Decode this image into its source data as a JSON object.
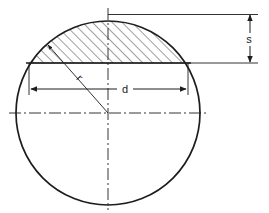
{
  "diagram": {
    "type": "engineering-cross-section",
    "stroke_color": "#1d1d1d",
    "hatch_color": "#2a2a2a",
    "background_color": "#ffffff",
    "shape": {
      "name": "circle",
      "center_x": 108,
      "center_y": 113,
      "radius": 92
    },
    "chord": {
      "y": 63,
      "left_x": 29,
      "right_x": 188
    },
    "labels": {
      "segment_height": "s",
      "chord_width": "d",
      "radius": "r"
    },
    "dimensions": [
      {
        "name": "segment-height",
        "label": "s",
        "orientation": "vertical",
        "line_x": 250,
        "from_y": 14,
        "to_y": 63,
        "label_x": 249,
        "label_y": 42
      },
      {
        "name": "chord-width",
        "label": "d",
        "orientation": "horizontal",
        "line_y": 89,
        "from_x": 29,
        "to_x": 188,
        "label_x": 125,
        "label_y": 92
      },
      {
        "name": "radius",
        "label": "r",
        "orientation": "diagonal",
        "from_x": 108,
        "from_y": 113,
        "to_x": 47,
        "to_y": 44,
        "label_x": 76,
        "label_y": 78,
        "label_rotation": 48
      }
    ],
    "centerlines": [
      {
        "name": "horizontal-centerline",
        "x1": 9,
        "y1": 113,
        "x2": 207,
        "y2": 113
      },
      {
        "name": "vertical-centerline",
        "x1": 108,
        "y1": 8,
        "x2": 108,
        "y2": 210
      }
    ]
  }
}
